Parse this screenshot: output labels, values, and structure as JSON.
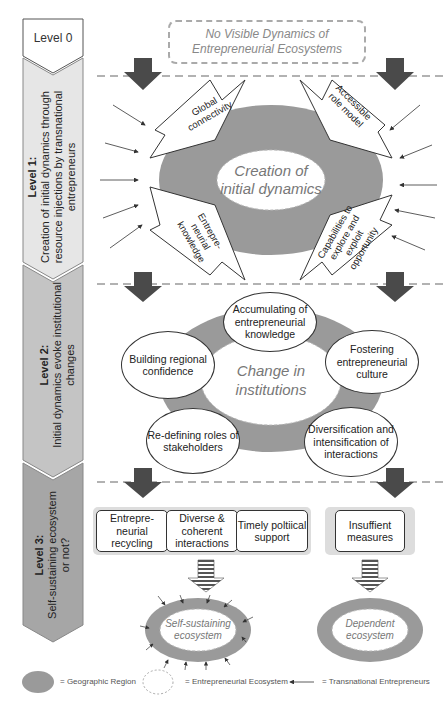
{
  "levels": [
    {
      "title": "Level 0",
      "subtitle": ""
    },
    {
      "title": "Level 1:",
      "subtitle": "Creation of initial dynamics through resource injections by transnational entrepreneurs"
    },
    {
      "title": "Level 2:",
      "subtitle": "Initial dynamics evoke institutional changes"
    },
    {
      "title": "Level 3:",
      "subtitle": "Self-sustaining ecosystem or not?"
    }
  ],
  "level0": {
    "box_text": "No Visible Dynamics of Entrepreneurial Ecosystems"
  },
  "level1": {
    "center_label": "Creation of initial dynamics",
    "spikes": [
      {
        "label": "Global connectivity",
        "position": "top-left"
      },
      {
        "label": "Accessible role model",
        "position": "top-right"
      },
      {
        "label": "Entrepre-neurial knowledge",
        "position": "bottom-left"
      },
      {
        "label": "Capabilities to explore and exploit opportunity",
        "position": "bottom-right"
      }
    ]
  },
  "level2": {
    "center_label": "Change in institutions",
    "circles": [
      {
        "label": "Accumulating of entrepreneurial knowledge"
      },
      {
        "label": "Building regional confidence"
      },
      {
        "label": "Fostering entrepreneurial culture"
      },
      {
        "label": "Re-defining roles of stakeholders"
      },
      {
        "label": "Diversification and intensification of interactions"
      }
    ]
  },
  "level3": {
    "left_boxes": [
      {
        "label": "Entrepre-neurial recycling"
      },
      {
        "label": "Diverse & coherent interactions"
      },
      {
        "label": "Timely poltiical support"
      }
    ],
    "right_box": {
      "label": "Insuffient measures"
    },
    "outcome_left": "Self-sustaining ecosystem",
    "outcome_right": "Dependent ecosystem"
  },
  "legend": [
    {
      "symbol": "grey-ellipse",
      "label": "= Geographic Region"
    },
    {
      "symbol": "dashed-ellipse",
      "label": "= Entrepreneurial Ecosystem"
    },
    {
      "symbol": "arrow",
      "label": "= Transnational Entrepreneurs"
    }
  ],
  "colors": {
    "region_grey": "#9a9a9a",
    "arrow_dark": "#4a4a4a",
    "level1_fill": "#e6e6e6",
    "level2_fill": "#c4c4c4",
    "level3_fill": "#a6a6a6"
  }
}
